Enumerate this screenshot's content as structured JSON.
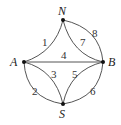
{
  "diagram": {
    "type": "graph",
    "nodes": [
      {
        "id": "N",
        "label": "N",
        "x": 63,
        "y": 20
      },
      {
        "id": "A",
        "label": "A",
        "x": 24,
        "y": 62
      },
      {
        "id": "B",
        "label": "B",
        "x": 103,
        "y": 62
      },
      {
        "id": "S",
        "label": "S",
        "x": 63,
        "y": 104
      }
    ],
    "edges": [
      {
        "label": "1",
        "from": "A",
        "to": "N"
      },
      {
        "label": "4",
        "from": "A",
        "to": "B"
      },
      {
        "label": "7",
        "from": "N",
        "to": "B"
      },
      {
        "label": "8",
        "from": "N",
        "to": "B"
      },
      {
        "label": "3",
        "from": "A",
        "to": "S"
      },
      {
        "label": "2",
        "from": "A",
        "to": "S"
      },
      {
        "label": "5",
        "from": "S",
        "to": "B"
      },
      {
        "label": "6",
        "from": "S",
        "to": "B"
      }
    ]
  }
}
